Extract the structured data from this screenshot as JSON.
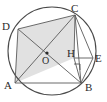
{
  "figure": {
    "type": "geometry-diagram",
    "background_color": "#ffffff",
    "stroke_color": "#4a4a4a",
    "shade_color": "#dcdcdc",
    "circle": {
      "name": "circumscribed-circle",
      "center_label": "O",
      "center_x": 52,
      "center_y": 51,
      "radius": 44
    },
    "points": [
      {
        "label": "A",
        "x": 15,
        "y": 83,
        "label_x": 6,
        "label_y": 89
      },
      {
        "label": "B",
        "x": 81,
        "y": 83,
        "label_x": 84,
        "label_y": 90
      },
      {
        "label": "C",
        "x": 75,
        "y": 15,
        "label_x": 73,
        "label_y": 11
      },
      {
        "label": "D",
        "x": 18,
        "y": 29,
        "label_x": 4,
        "label_y": 26
      },
      {
        "label": "H",
        "x": 74,
        "y": 58,
        "label_x": 69,
        "label_y": 56
      },
      {
        "label": "E",
        "x": 93,
        "y": 58,
        "label_x": 95,
        "label_y": 61
      },
      {
        "label": "O",
        "x": 47,
        "y": 54,
        "label_x": 42,
        "label_y": 62
      }
    ],
    "segments": [
      {
        "name": "segment-AB",
        "from": "A",
        "to": "B"
      },
      {
        "name": "segment-BC",
        "from": "B",
        "to": "C"
      },
      {
        "name": "segment-CD",
        "from": "C",
        "to": "D"
      },
      {
        "name": "segment-DA",
        "from": "D",
        "to": "A"
      },
      {
        "name": "segment-AC",
        "from": "A",
        "to": "C"
      },
      {
        "name": "segment-DB",
        "from": "D",
        "to": "B"
      },
      {
        "name": "segment-CH",
        "from": "C",
        "to": "H"
      },
      {
        "name": "segment-CE",
        "from": "C",
        "to": "E"
      },
      {
        "name": "segment-HE",
        "from": "H",
        "to": "E"
      },
      {
        "name": "segment-HB",
        "from": "H",
        "to": "B"
      },
      {
        "name": "segment-EB",
        "from": "E",
        "to": "B"
      }
    ],
    "shaded_region": {
      "name": "shaded-quadrilateral-ADCH",
      "vertices": [
        "A",
        "D",
        "C",
        "H"
      ]
    },
    "right_angle": {
      "name": "right-angle-at-H",
      "at": "H",
      "size": 6
    }
  }
}
